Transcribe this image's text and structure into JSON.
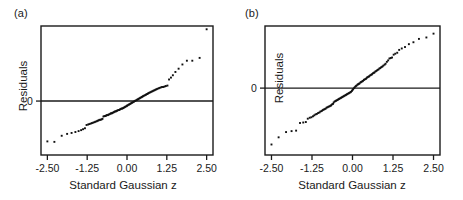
{
  "figure": {
    "background": "#ffffff",
    "ink": "#1a1a1a",
    "point_color": "#111111"
  },
  "panels": [
    {
      "id": "a",
      "tag": "(a)",
      "xlabel": "Standard Gaussian z",
      "ylabel": "Residuals",
      "xticks": [
        "-2.50",
        "-1.25",
        "0.00",
        "1.25",
        "2.50"
      ],
      "yticks": [
        "0"
      ]
    },
    {
      "id": "b",
      "tag": "(b)",
      "xlabel": "Standard Gaussian z",
      "ylabel": "Residuals",
      "xticks": [
        "-2.50",
        "-1.25",
        "0.00",
        "1.25",
        "2.50"
      ],
      "yticks": [
        "0"
      ]
    }
  ],
  "chart_data": [
    {
      "type": "scatter",
      "title": "(a)",
      "xlabel": "Standard Gaussian z",
      "ylabel": "Residuals",
      "xlim": [
        -2.7,
        2.7
      ],
      "ylim": [
        -1.15,
        1.6
      ],
      "xticks": [
        -2.5,
        -1.25,
        0.0,
        1.25,
        2.5
      ],
      "ytick_values": [
        0
      ],
      "ytick_labels": [
        "0"
      ],
      "grid": false,
      "legend": "none",
      "reference_line": {
        "type": "horizontal",
        "y": 0
      },
      "frame": "box",
      "x": [
        -2.5,
        -2.28,
        -2.05,
        -1.88,
        -1.74,
        -1.62,
        -1.52,
        -1.44,
        -1.38,
        -1.32,
        -1.27,
        -1.22,
        -1.18,
        -1.14,
        -1.1,
        -1.06,
        -1.02,
        -0.99,
        -0.95,
        -0.92,
        -0.89,
        -0.86,
        -0.83,
        -0.8,
        -0.77,
        -0.74,
        -0.71,
        -0.68,
        -0.66,
        -0.63,
        -0.6,
        -0.58,
        -0.55,
        -0.52,
        -0.5,
        -0.47,
        -0.45,
        -0.42,
        -0.4,
        -0.37,
        -0.35,
        -0.32,
        -0.3,
        -0.27,
        -0.25,
        -0.22,
        -0.2,
        -0.17,
        -0.15,
        -0.12,
        -0.1,
        -0.07,
        -0.05,
        -0.02,
        0.0,
        0.02,
        0.05,
        0.07,
        0.1,
        0.12,
        0.15,
        0.17,
        0.2,
        0.22,
        0.25,
        0.27,
        0.3,
        0.32,
        0.35,
        0.37,
        0.4,
        0.42,
        0.45,
        0.47,
        0.5,
        0.52,
        0.55,
        0.58,
        0.6,
        0.63,
        0.66,
        0.68,
        0.71,
        0.74,
        0.77,
        0.8,
        0.83,
        0.86,
        0.89,
        0.92,
        0.95,
        0.99,
        1.02,
        1.06,
        1.1,
        1.14,
        1.18,
        1.22,
        1.27,
        1.32,
        1.38,
        1.44,
        1.52,
        1.62,
        1.74,
        1.88,
        2.05,
        2.28,
        2.5
      ],
      "y": [
        -0.86,
        -0.87,
        -0.74,
        -0.7,
        -0.68,
        -0.66,
        -0.64,
        -0.62,
        -0.6,
        -0.58,
        -0.51,
        -0.5,
        -0.49,
        -0.48,
        -0.47,
        -0.46,
        -0.45,
        -0.44,
        -0.43,
        -0.42,
        -0.41,
        -0.4,
        -0.4,
        -0.39,
        -0.38,
        -0.33,
        -0.32,
        -0.32,
        -0.31,
        -0.3,
        -0.3,
        -0.29,
        -0.28,
        -0.27,
        -0.26,
        -0.26,
        -0.25,
        -0.24,
        -0.23,
        -0.22,
        -0.22,
        -0.21,
        -0.2,
        -0.19,
        -0.19,
        -0.18,
        -0.17,
        -0.16,
        -0.16,
        -0.15,
        -0.14,
        -0.13,
        -0.12,
        -0.11,
        -0.1,
        -0.09,
        -0.08,
        -0.07,
        -0.06,
        -0.05,
        -0.04,
        -0.03,
        -0.02,
        -0.01,
        0.0,
        0.01,
        0.02,
        0.03,
        0.04,
        0.05,
        0.06,
        0.07,
        0.08,
        0.09,
        0.1,
        0.11,
        0.12,
        0.13,
        0.14,
        0.15,
        0.16,
        0.17,
        0.18,
        0.19,
        0.2,
        0.21,
        0.22,
        0.23,
        0.24,
        0.25,
        0.26,
        0.27,
        0.28,
        0.29,
        0.3,
        0.3,
        0.31,
        0.32,
        0.33,
        0.46,
        0.5,
        0.55,
        0.62,
        0.69,
        0.78,
        0.86,
        0.86,
        0.92,
        1.53
      ]
    },
    {
      "type": "scatter",
      "title": "(b)",
      "xlabel": "Standard Gaussian z",
      "ylabel": "Residuals",
      "xlim": [
        -2.7,
        2.7
      ],
      "ylim": [
        -1.4,
        1.3
      ],
      "xticks": [
        -2.5,
        -1.25,
        0.0,
        1.25,
        2.5
      ],
      "ytick_values": [
        0
      ],
      "ytick_labels": [
        "0"
      ],
      "grid": false,
      "legend": "none",
      "reference_line": {
        "type": "horizontal",
        "y": 0
      },
      "frame": "box",
      "x": [
        -2.5,
        -2.28,
        -2.05,
        -1.88,
        -1.74,
        -1.62,
        -1.52,
        -1.44,
        -1.38,
        -1.32,
        -1.27,
        -1.22,
        -1.18,
        -1.14,
        -1.1,
        -1.06,
        -1.02,
        -0.99,
        -0.95,
        -0.92,
        -0.89,
        -0.86,
        -0.83,
        -0.8,
        -0.77,
        -0.74,
        -0.71,
        -0.68,
        -0.66,
        -0.63,
        -0.6,
        -0.58,
        -0.55,
        -0.52,
        -0.5,
        -0.47,
        -0.45,
        -0.42,
        -0.4,
        -0.37,
        -0.35,
        -0.32,
        -0.3,
        -0.27,
        -0.25,
        -0.22,
        -0.2,
        -0.17,
        -0.15,
        -0.12,
        -0.1,
        -0.07,
        -0.05,
        -0.02,
        0.0,
        0.02,
        0.05,
        0.07,
        0.1,
        0.12,
        0.15,
        0.17,
        0.2,
        0.22,
        0.25,
        0.27,
        0.3,
        0.32,
        0.35,
        0.37,
        0.4,
        0.42,
        0.45,
        0.47,
        0.5,
        0.52,
        0.55,
        0.58,
        0.6,
        0.63,
        0.66,
        0.68,
        0.71,
        0.74,
        0.77,
        0.8,
        0.83,
        0.86,
        0.89,
        0.92,
        0.95,
        0.99,
        1.02,
        1.06,
        1.1,
        1.14,
        1.18,
        1.22,
        1.27,
        1.32,
        1.38,
        1.44,
        1.52,
        1.62,
        1.74,
        1.88,
        2.05,
        2.28,
        2.5
      ],
      "y": [
        -1.18,
        -1.03,
        -0.92,
        -0.9,
        -0.89,
        -0.73,
        -0.72,
        -0.71,
        -0.64,
        -0.62,
        -0.61,
        -0.59,
        -0.57,
        -0.55,
        -0.54,
        -0.52,
        -0.51,
        -0.49,
        -0.48,
        -0.46,
        -0.45,
        -0.44,
        -0.43,
        -0.41,
        -0.4,
        -0.39,
        -0.38,
        -0.37,
        -0.36,
        -0.34,
        -0.33,
        -0.3,
        -0.28,
        -0.27,
        -0.26,
        -0.25,
        -0.24,
        -0.23,
        -0.22,
        -0.21,
        -0.2,
        -0.19,
        -0.18,
        -0.17,
        -0.16,
        -0.15,
        -0.14,
        -0.13,
        -0.12,
        -0.11,
        -0.1,
        -0.09,
        -0.08,
        -0.06,
        -0.04,
        -0.02,
        0.0,
        0.02,
        0.04,
        0.05,
        0.07,
        0.08,
        0.09,
        0.1,
        0.12,
        0.13,
        0.14,
        0.15,
        0.17,
        0.18,
        0.19,
        0.2,
        0.22,
        0.23,
        0.24,
        0.25,
        0.27,
        0.28,
        0.29,
        0.31,
        0.32,
        0.33,
        0.35,
        0.36,
        0.38,
        0.39,
        0.41,
        0.42,
        0.44,
        0.45,
        0.47,
        0.49,
        0.51,
        0.55,
        0.58,
        0.62,
        0.63,
        0.64,
        0.7,
        0.72,
        0.74,
        0.8,
        0.83,
        0.86,
        0.92,
        0.96,
        1.03,
        1.06,
        1.14
      ]
    }
  ]
}
